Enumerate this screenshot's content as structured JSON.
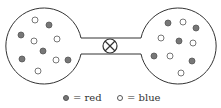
{
  "diagram": {
    "colors": {
      "red": "#777777",
      "blue": "#ffffff",
      "stroke": "#333333"
    },
    "left_bulb": {
      "particles": [
        {
          "x": 35,
          "y": 20,
          "type": "blue"
        },
        {
          "x": 49,
          "y": 25,
          "type": "red"
        },
        {
          "x": 21,
          "y": 35,
          "type": "red"
        },
        {
          "x": 34,
          "y": 41,
          "type": "blue"
        },
        {
          "x": 57,
          "y": 39,
          "type": "blue"
        },
        {
          "x": 43,
          "y": 51,
          "type": "red"
        },
        {
          "x": 22,
          "y": 59,
          "type": "red"
        },
        {
          "x": 56,
          "y": 60,
          "type": "blue"
        },
        {
          "x": 68,
          "y": 60,
          "type": "red"
        },
        {
          "x": 38,
          "y": 71,
          "type": "blue"
        }
      ]
    },
    "right_bulb": {
      "particles": [
        {
          "x": 168,
          "y": 23,
          "type": "red"
        },
        {
          "x": 183,
          "y": 22,
          "type": "blue"
        },
        {
          "x": 196,
          "y": 28,
          "type": "red"
        },
        {
          "x": 161,
          "y": 38,
          "type": "blue"
        },
        {
          "x": 179,
          "y": 41,
          "type": "red"
        },
        {
          "x": 193,
          "y": 43,
          "type": "blue"
        },
        {
          "x": 154,
          "y": 56,
          "type": "red"
        },
        {
          "x": 170,
          "y": 56,
          "type": "blue"
        },
        {
          "x": 192,
          "y": 61,
          "type": "red"
        },
        {
          "x": 181,
          "y": 73,
          "type": "blue"
        }
      ]
    },
    "valve": "closed-valve"
  },
  "legend": {
    "red_label": "= red",
    "blue_label": "= blue"
  }
}
